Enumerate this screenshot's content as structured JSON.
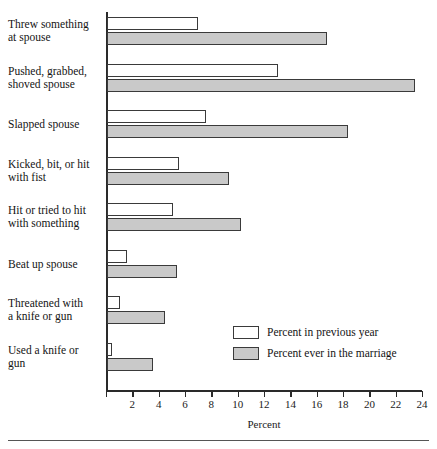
{
  "chart_data": {
    "type": "bar",
    "orientation": "horizontal",
    "title": "",
    "xlabel": "Percent",
    "ylabel": "",
    "xlim": [
      0,
      24
    ],
    "xticks": [
      0,
      2,
      4,
      6,
      8,
      10,
      12,
      14,
      16,
      18,
      20,
      22,
      24
    ],
    "xtick_labels": [
      "",
      "2",
      "4",
      "6",
      "8",
      "10",
      "12",
      "14",
      "16",
      "18",
      "20",
      "22",
      "24"
    ],
    "grid": false,
    "legend_position": "inside-lower-right",
    "categories": [
      "Threw something at spouse",
      "Pushed, grabbed, shoved spouse",
      "Slapped spouse",
      "Kicked, bit, or hit with fist",
      "Hit or tried to hit with something",
      "Beat up spouse",
      "Threatened with a knife or gun",
      "Used a knife or gun"
    ],
    "series": [
      {
        "name": "Percent in previous year",
        "color": "#ffffff",
        "values": [
          6.9,
          13.0,
          7.5,
          5.5,
          5.0,
          1.5,
          1.0,
          0.4
        ]
      },
      {
        "name": "Percent ever in the marriage",
        "color": "#c9c9c9",
        "values": [
          16.7,
          23.4,
          18.3,
          9.3,
          10.2,
          5.3,
          4.4,
          3.5
        ]
      }
    ]
  },
  "category_labels": [
    {
      "line1": "Threw something",
      "line2": "at spouse"
    },
    {
      "line1": "Pushed, grabbed,",
      "line2": "shoved spouse"
    },
    {
      "line1": "Slapped spouse",
      "line2": ""
    },
    {
      "line1": "Kicked, bit, or hit",
      "line2": "with fist"
    },
    {
      "line1": "Hit or tried to hit",
      "line2": "with something"
    },
    {
      "line1": "Beat up spouse",
      "line2": ""
    },
    {
      "line1": "Threatened with",
      "line2": "a knife or gun"
    },
    {
      "line1": "Used a knife or",
      "line2": "gun"
    }
  ],
  "legend": {
    "items": [
      {
        "label": "Percent in previous year",
        "swatch": "white-swatch"
      },
      {
        "label": "Percent ever in the marriage",
        "swatch": "gray-swatch"
      }
    ]
  },
  "axis": {
    "x_title": "Percent"
  }
}
